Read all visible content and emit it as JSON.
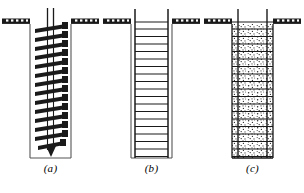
{
  "figure": {
    "background_color": "#ffffff",
    "line_color": "#1a1a1a",
    "fill_color": "#ffffff",
    "width": 304,
    "height": 193
  },
  "panels": [
    {
      "id": "a",
      "caption": "(a)",
      "name": "drilling-with-auger",
      "description": "Continuous flight auger advancing an open borehole below the ground surface",
      "elements": {
        "ground_line": "ground-surface-hatched",
        "shaft": "open-borehole-walls",
        "tool": "continuous-flight-auger",
        "rod": "twin-drill-rod",
        "flight_count": 14,
        "bit": "pointed-auger-tip"
      }
    },
    {
      "id": "b",
      "caption": "(b)",
      "name": "reinforcing-cage-placed",
      "description": "Steel reinforcing cage lowered into the completed empty shaft",
      "elements": {
        "ground_line": "ground-surface-hatched",
        "shaft": "open-borehole-walls",
        "tool": "reinforcing-cage-ladder",
        "rod": "twin-vertical-bars",
        "rung_count": 19,
        "bit": "none"
      }
    },
    {
      "id": "c",
      "caption": "(c)",
      "name": "concrete-placed",
      "description": "Shaft filled with concrete encasing the reinforcing cage, aggregate texture shown",
      "elements": {
        "ground_line": "ground-surface-hatched",
        "shaft": "concrete-filled-shaft",
        "tool": "encased-reinforcing-cage",
        "rod": "twin-vertical-bars",
        "rung_count": 19,
        "bit": "none",
        "fill_texture": "concrete-aggregate-speckle"
      }
    }
  ],
  "geometry": {
    "ground_y": 24,
    "shaft_left": 30,
    "shaft_right": 71,
    "shaft_bottom": 158,
    "rod_top": 8,
    "ground_left_start": 2,
    "ground_right_end": 99,
    "hatch_tick_count": 5
  }
}
